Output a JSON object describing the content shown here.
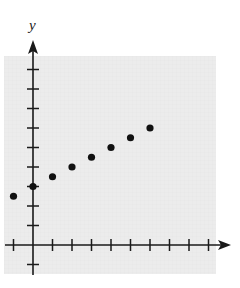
{
  "chart_data": {
    "type": "scatter",
    "title": "",
    "xlabel": "",
    "ylabel": "y",
    "x": [
      -1,
      0,
      1,
      2,
      3,
      4,
      5,
      6
    ],
    "y": [
      2.5,
      3,
      3.5,
      4,
      4.5,
      5,
      5.5,
      6
    ],
    "series": [
      {
        "name": "points",
        "x": [
          -1,
          0,
          1,
          2,
          3,
          4,
          5,
          6
        ],
        "y": [
          2.5,
          3,
          3.5,
          4,
          4.5,
          5,
          5.5,
          6
        ]
      }
    ],
    "xlim": [
      -1,
      9
    ],
    "ylim": [
      -1,
      9
    ],
    "x_ticks": [
      -1,
      1,
      2,
      3,
      4,
      5,
      6,
      7,
      8,
      9
    ],
    "y_ticks": [
      -1,
      1,
      2,
      3,
      4,
      5,
      6,
      7,
      8,
      9
    ],
    "tick_labels_shown": false,
    "grid": true,
    "legend": null
  },
  "colors": {
    "background": "#ebebeb",
    "axis": "#1a1a1a",
    "point": "#111111"
  }
}
